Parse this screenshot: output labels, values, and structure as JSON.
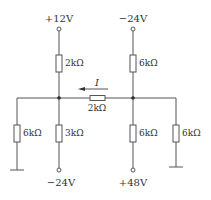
{
  "diagram": {
    "type": "circuit",
    "sources": {
      "top_left": "+12V",
      "top_right": "−24V",
      "bottom_left": "−24V",
      "bottom_right": "+48V"
    },
    "resistors": {
      "top_left": "2kΩ",
      "top_right": "6kΩ",
      "middle": "2kΩ",
      "bottom_far_left": "6kΩ",
      "bottom_left": "3kΩ",
      "bottom_right": "6kΩ",
      "bottom_far_right": "6kΩ"
    },
    "current_label": "I",
    "current_direction": "left",
    "colors": {
      "wire": "#555555",
      "text": "#333333",
      "background": "#ffffff"
    }
  }
}
